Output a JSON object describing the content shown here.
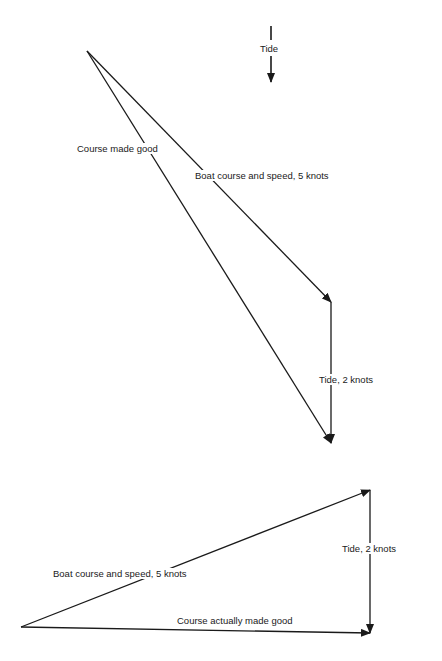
{
  "legend": {
    "label": "Tide"
  },
  "upper_diagram": {
    "course_made_good": "Course made good",
    "boat_vector": "Boat course and speed, 5 knots",
    "tide_vector": "Tide, 2 knots"
  },
  "lower_diagram": {
    "boat_vector": "Boat course and speed, 5 knots",
    "tide_vector": "Tide, 2 knots",
    "course_made_good": "Course actually made good"
  },
  "colors": {
    "line": "#1a1a1a",
    "background": "#ffffff"
  }
}
